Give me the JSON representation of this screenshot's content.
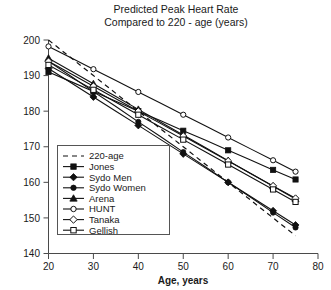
{
  "chart_data": {
    "type": "line",
    "title": "Predicted Peak Heart Rate",
    "subtitle": "Compared to 220 - age (years)",
    "title_lines": [
      "Predicted Peak Heart Rate",
      "Compared to 220 - age (years)"
    ],
    "xlabel": "Age, years",
    "ylabel": "",
    "xlim": [
      20,
      80
    ],
    "ylim": [
      140,
      200
    ],
    "xticks": [
      20,
      30,
      40,
      50,
      60,
      70,
      80
    ],
    "xtick_labels": [
      "20",
      "30",
      "40",
      "50",
      "60",
      "70",
      "80"
    ],
    "yticks": [
      140,
      150,
      160,
      170,
      180,
      190,
      200
    ],
    "ytick_labels": [
      "140",
      "150",
      "160",
      "170",
      "180",
      "190",
      "200"
    ],
    "grid": false,
    "legend_position": "center-left",
    "x": [
      20,
      25,
      30,
      35,
      40,
      45,
      50,
      55,
      60,
      65,
      70,
      75
    ],
    "series": [
      {
        "name": "220-age",
        "marker": "none",
        "line": "dashed",
        "fill": "none",
        "values": [
          200.0,
          195.0,
          190.0,
          185.0,
          180.0,
          175.0,
          170.0,
          165.0,
          160.0,
          155.0,
          150.0,
          145.0
        ]
      },
      {
        "name": "Jones",
        "marker": "square",
        "line": "solid",
        "fill": "filled",
        "values": [
          191.0,
          188.3,
          185.5,
          182.8,
          180.0,
          177.3,
          174.5,
          171.8,
          169.0,
          166.3,
          163.5,
          160.8
        ]
      },
      {
        "name": "Sydo Men",
        "marker": "diamond",
        "line": "solid",
        "fill": "filled",
        "values": [
          192.0,
          188.0,
          184.0,
          180.0,
          176.0,
          172.0,
          168.0,
          164.0,
          160.0,
          156.0,
          152.0,
          148.0
        ]
      },
      {
        "name": "Sydo Women",
        "marker": "circle",
        "line": "solid",
        "fill": "filled",
        "values": [
          194.0,
          189.8,
          185.5,
          181.3,
          177.0,
          172.8,
          168.5,
          164.3,
          160.0,
          155.8,
          151.5,
          147.3
        ]
      },
      {
        "name": "Arena",
        "marker": "triangle",
        "line": "solid",
        "fill": "filled",
        "values": [
          194.9,
          191.3,
          187.7,
          184.1,
          180.5,
          176.9,
          173.3,
          169.7,
          166.1,
          162.5,
          158.9,
          155.3
        ]
      },
      {
        "name": "HUNT",
        "marker": "circle",
        "line": "solid",
        "fill": "open",
        "values": [
          198.2,
          195.0,
          191.8,
          188.6,
          185.4,
          182.2,
          179.0,
          175.8,
          172.6,
          169.4,
          166.2,
          163.0
        ]
      },
      {
        "name": "Tanaka",
        "marker": "diamond",
        "line": "solid",
        "fill": "open",
        "values": [
          194.0,
          190.5,
          187.0,
          183.5,
          180.0,
          176.5,
          173.0,
          169.5,
          166.0,
          162.5,
          159.0,
          155.5
        ]
      },
      {
        "name": "Gellish",
        "marker": "square",
        "line": "solid",
        "fill": "open",
        "values": [
          193.0,
          189.5,
          186.0,
          182.5,
          179.0,
          175.5,
          172.0,
          168.5,
          165.0,
          161.5,
          158.0,
          154.5
        ]
      }
    ]
  },
  "legend": {
    "items": [
      {
        "label": "220-age"
      },
      {
        "label": "Jones"
      },
      {
        "label": "Sydo Men"
      },
      {
        "label": "Sydo Women"
      },
      {
        "label": "Arena"
      },
      {
        "label": "HUNT"
      },
      {
        "label": "Tanaka"
      },
      {
        "label": "Gellish"
      }
    ]
  },
  "colors": {
    "line": "#111111",
    "axis": "#4a4a4a",
    "text": "#1a1a1a",
    "background": "#ffffff"
  }
}
